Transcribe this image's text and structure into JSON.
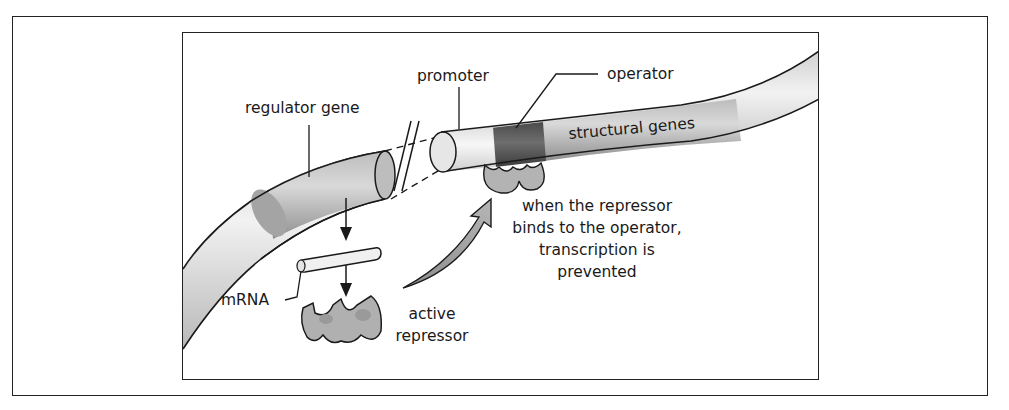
{
  "diagram": {
    "labels": {
      "regulator_gene": "regulator gene",
      "promoter": "promoter",
      "operator": "operator",
      "structural_genes": "structural genes",
      "mrna": "mRNA",
      "active_repressor_line1": "active",
      "active_repressor_line2": "repressor",
      "caption_line1": "when the repressor",
      "caption_line2": "binds to the operator,",
      "caption_line3": "transcription is",
      "caption_line4": "prevented"
    },
    "icons": {
      "break_mark": "double-slash",
      "flow_arrows": "down-arrow",
      "binding_arrow": "curved-arrow"
    },
    "colors": {
      "dna_light": "#e6e6e6",
      "dna_mid": "#bdbdbd",
      "gene_segment": "#a9a9a9",
      "operator_dark": "#5a5a5a",
      "repressor": "#b3b3b3",
      "outline": "#1a1a1a"
    }
  }
}
